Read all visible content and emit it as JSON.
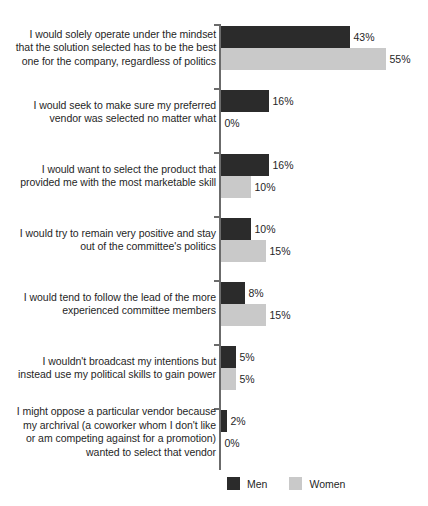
{
  "chart_data": {
    "type": "bar",
    "orientation": "horizontal",
    "title": "",
    "subtitle": "",
    "xlabel": "",
    "ylabel": "",
    "xlim": [
      0,
      60
    ],
    "grid": false,
    "legend_position": "bottom",
    "value_suffix": "%",
    "categories": [
      "I would solely operate under the mindset\nthat the solution selected has to be the best\none for the company, regardless of politics",
      "I would seek to make sure my preferred\nvendor was selected no matter what",
      "I would want to select the product that\nprovided me with the most marketable skill",
      "I would try to remain very positive and stay\nout of the committee's politics",
      "I would tend to follow the lead of the more\nexperienced committee members",
      "I wouldn't broadcast my intentions but\ninstead use my political skills to gain power",
      "I might oppose a particular vendor because\nmy archrival (a coworker whom I don't like\nor am competing against for a promotion)\nwanted to select that vendor"
    ],
    "series": [
      {
        "name": "Men",
        "color": "#2b2b2b",
        "values": [
          43,
          16,
          16,
          10,
          8,
          5,
          2
        ],
        "labels": [
          "43%",
          "16%",
          "16%",
          "10%",
          "8%",
          "5%",
          "2%"
        ]
      },
      {
        "name": "Women",
        "color": "#c9c9c9",
        "values": [
          55,
          0,
          10,
          15,
          15,
          5,
          0
        ],
        "labels": [
          "55%",
          "0%",
          "10%",
          "15%",
          "15%",
          "5%",
          "0%"
        ]
      }
    ]
  },
  "legend": {
    "items": [
      {
        "label": "Men",
        "color": "#2b2b2b"
      },
      {
        "label": "Women",
        "color": "#c9c9c9"
      }
    ]
  }
}
